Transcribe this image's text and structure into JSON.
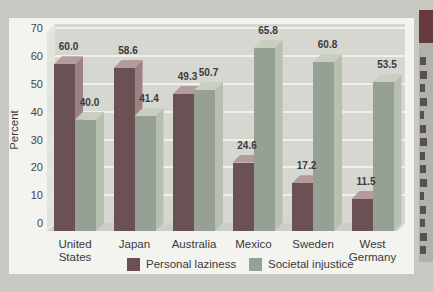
{
  "chart_data": {
    "type": "bar",
    "title": "",
    "categories": [
      "United\nStates",
      "Japan",
      "Australia",
      "Mexico",
      "Sweden",
      "West\nGermany"
    ],
    "series": [
      {
        "name": "Personal laziness",
        "values": [
          60.0,
          58.6,
          49.3,
          24.6,
          17.2,
          11.5
        ],
        "color_front": "#6b5153",
        "color_side": "#9b8183",
        "color_top": "#b49c9d"
      },
      {
        "name": "Societal injustice",
        "values": [
          40.0,
          41.4,
          50.7,
          65.8,
          60.8,
          53.5
        ],
        "color_front": "#96a094",
        "color_side": "#b7bfb0",
        "color_top": "#c8cec0"
      }
    ],
    "value_labels": [
      [
        "60.0",
        "58.6",
        "49.3",
        "24.6",
        "17.2",
        "11.5"
      ],
      [
        "40.0",
        "41.4",
        "50.7",
        "65.8",
        "60.8",
        "53.5"
      ]
    ],
    "xlabel": "",
    "ylabel": "Percent",
    "ylim": [
      0,
      70
    ],
    "ytick_step": 10,
    "yticks": [
      "0",
      "10",
      "20",
      "30",
      "40",
      "50",
      "60",
      "70"
    ],
    "grid": true,
    "legend_position": "bottom",
    "style": "pseudo-3d"
  },
  "colors": {
    "page_background": "#c6c8c1",
    "panel_background": "#f3f3ef",
    "wall": "#d5d7d0",
    "gridline": "#eef0e9",
    "sidebar_header": "#693a3d",
    "sidebar_body": "#b1b1af"
  },
  "sidebar": {
    "note": "cropped text column at right edge of scan"
  }
}
